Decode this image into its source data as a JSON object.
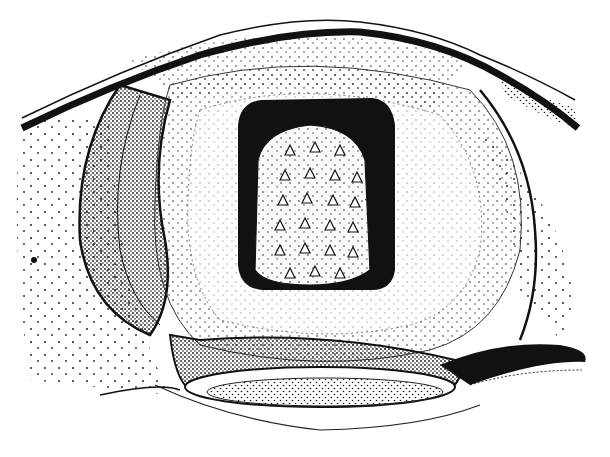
{
  "figure": {
    "type": "stippled anatomical illustration",
    "width": 610,
    "height": 457,
    "background": "#ffffff",
    "ink": "#111111",
    "labels": []
  },
  "regions": [
    {
      "name": "outer-body-band",
      "description": "curved dark band across upper edge"
    },
    {
      "name": "left-fold",
      "description": "stippled crescent lobe on left"
    },
    {
      "name": "ring-rim",
      "description": "pale concentric rim around central cavity"
    },
    {
      "name": "central-cavity",
      "description": "dark rounded-rectangle opening"
    },
    {
      "name": "papillae-pad",
      "description": "pad covered in triangular spines/papillae"
    },
    {
      "name": "lower-lip",
      "description": "elongated stippled oval at bottom"
    },
    {
      "name": "right-fold",
      "description": "dark curved flap on lower right"
    }
  ]
}
